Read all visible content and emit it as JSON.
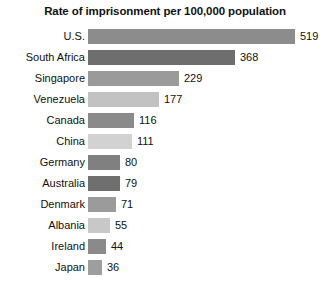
{
  "chart_data": {
    "type": "bar",
    "orientation": "horizontal",
    "title": "Rate of imprisonment per 100,000 population",
    "xlabel": "",
    "ylabel": "",
    "xlim": [
      0,
      519
    ],
    "grid": false,
    "legend": null,
    "categories": [
      "U.S.",
      "South Africa",
      "Singapore",
      "Venezuela",
      "Canada",
      "China",
      "Germany",
      "Australia",
      "Denmark",
      "Albania",
      "Ireland",
      "Japan"
    ],
    "values": [
      519,
      368,
      229,
      177,
      116,
      111,
      80,
      79,
      71,
      55,
      44,
      36
    ],
    "value_labels": [
      "519",
      "368",
      "229",
      "177",
      "116",
      "111",
      "80",
      "79",
      "71",
      "55",
      "44",
      "36"
    ],
    "bar_colors": [
      "#8c8c8c",
      "#6e6e6e",
      "#9a9a9a",
      "#c2c2c2",
      "#8a8a8a",
      "#d2d2d2",
      "#808080",
      "#6f6f6f",
      "#9b9b9b",
      "#c8c8c8",
      "#8a8a8a",
      "#9e9e9e"
    ]
  },
  "colors": {
    "background": "#ffffff",
    "text": "#111111",
    "title": "#121212"
  }
}
